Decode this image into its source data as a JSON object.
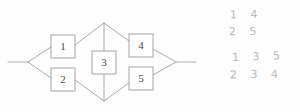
{
  "diagram": {
    "type": "bridge-network",
    "nodes": [
      {
        "id": "n1",
        "label": "1",
        "cx": 63,
        "cy": 46
      },
      {
        "id": "n2",
        "label": "2",
        "cx": 63,
        "cy": 79
      },
      {
        "id": "n3",
        "label": "3",
        "cx": 104,
        "cy": 62
      },
      {
        "id": "n4",
        "label": "4",
        "cx": 141,
        "cy": 45
      },
      {
        "id": "n5",
        "label": "5",
        "cx": 141,
        "cy": 78
      }
    ],
    "box_width": 24,
    "box_height": 23,
    "vertices": {
      "left_junction": {
        "x": 28,
        "y": 62
      },
      "top_junction": {
        "x": 104,
        "y": 23
      },
      "bottom_junction": {
        "x": 104,
        "y": 101
      },
      "right_junction": {
        "x": 176,
        "y": 62
      }
    },
    "terminal_leads": {
      "left": {
        "x1": 8,
        "y1": 62,
        "x2": 28,
        "y2": 62
      },
      "right": {
        "x1": 176,
        "y1": 62,
        "x2": 196,
        "y2": 62
      }
    },
    "edges": [
      {
        "from": "left_junction",
        "to": "n1-left"
      },
      {
        "from": "left_junction",
        "to": "n2-left"
      },
      {
        "from": "n1-right",
        "to": "top_junction"
      },
      {
        "from": "n2-right",
        "to": "bottom_junction"
      },
      {
        "from": "top_junction",
        "to": "n3-top"
      },
      {
        "from": "n3-bottom",
        "to": "bottom_junction"
      },
      {
        "from": "top_junction",
        "to": "n4-left"
      },
      {
        "from": "bottom_junction",
        "to": "n5-left"
      },
      {
        "from": "n4-right",
        "to": "right_junction"
      },
      {
        "from": "n5-right",
        "to": "right_junction"
      }
    ]
  },
  "annotations": {
    "title": "path-lists",
    "rows": [
      {
        "id": "row-1",
        "text": "1 4"
      },
      {
        "id": "row-2",
        "text": "2 5"
      },
      {
        "id": "row-3",
        "text": "1 3 5"
      },
      {
        "id": "row-4",
        "text": "2 3 4"
      }
    ]
  },
  "colors": {
    "background": "#fdfdfd",
    "line": "#a2a2a2",
    "box_stroke": "#9a9a9a",
    "box_fill": "#ffffff",
    "label_text": "#4a4a4a",
    "hand_text": "#b9b9b9"
  }
}
